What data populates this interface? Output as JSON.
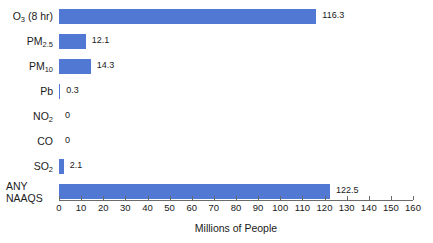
{
  "chart_data": {
    "type": "bar",
    "orientation": "horizontal",
    "title": "",
    "xlabel": "Millions of People",
    "ylabel": "",
    "xlim": [
      0,
      160
    ],
    "xticks": [
      0,
      10,
      20,
      30,
      40,
      50,
      60,
      70,
      80,
      90,
      100,
      110,
      120,
      130,
      140,
      150,
      160
    ],
    "grid": false,
    "legend": null,
    "bar_color": "#5179d4",
    "categories": [
      "O3 (8 hr)",
      "PM2.5",
      "PM10",
      "Pb",
      "NO2",
      "CO",
      "SO2",
      "ANY NAAQS"
    ],
    "values": [
      116.3,
      12.1,
      14.3,
      0.3,
      0,
      0,
      2.1,
      122.5
    ],
    "value_labels": [
      "116.3",
      "12.1",
      "14.3",
      "0.3",
      "0",
      "0",
      "2.1",
      "122.5"
    ],
    "bars": [
      {
        "label_main": "O",
        "label_sub": "3",
        "label_tail": " (8 hr)",
        "two_line": false,
        "line1": "",
        "line2": "",
        "value": 116.3,
        "value_label": "116.3"
      },
      {
        "label_main": "PM",
        "label_sub": "2.5",
        "label_tail": "",
        "two_line": false,
        "line1": "",
        "line2": "",
        "value": 12.1,
        "value_label": "12.1"
      },
      {
        "label_main": "PM",
        "label_sub": "10",
        "label_tail": "",
        "two_line": false,
        "line1": "",
        "line2": "",
        "value": 14.3,
        "value_label": "14.3"
      },
      {
        "label_main": "Pb",
        "label_sub": "",
        "label_tail": "",
        "two_line": false,
        "line1": "",
        "line2": "",
        "value": 0.3,
        "value_label": "0.3"
      },
      {
        "label_main": "NO",
        "label_sub": "2",
        "label_tail": "",
        "two_line": false,
        "line1": "",
        "line2": "",
        "value": 0,
        "value_label": "0"
      },
      {
        "label_main": "CO",
        "label_sub": "",
        "label_tail": "",
        "two_line": false,
        "line1": "",
        "line2": "",
        "value": 0,
        "value_label": "0"
      },
      {
        "label_main": "SO",
        "label_sub": "2",
        "label_tail": "",
        "two_line": false,
        "line1": "",
        "line2": "",
        "value": 2.1,
        "value_label": "2.1"
      },
      {
        "label_main": "",
        "label_sub": "",
        "label_tail": "",
        "two_line": true,
        "line1": "ANY",
        "line2": "NAAQS",
        "value": 122.5,
        "value_label": "122.5"
      }
    ]
  }
}
